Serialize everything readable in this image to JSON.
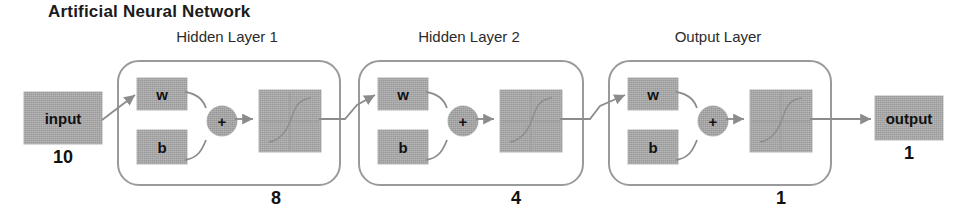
{
  "diagram": {
    "title": "Artificial Neural Network",
    "type": "neural-network-architecture",
    "colors": {
      "block_fill": "#a9a9a9",
      "layer_border": "#9a9a9a",
      "arrow": "#8c8c8c",
      "text": "#1a1a1a"
    },
    "input": {
      "label": "input",
      "count": "10"
    },
    "layers": [
      {
        "caption": "Hidden Layer 1",
        "weight_label": "w",
        "bias_label": "b",
        "sum_label": "+",
        "activation_label": "",
        "count": "8"
      },
      {
        "caption": "Hidden Layer 2",
        "weight_label": "w",
        "bias_label": "b",
        "sum_label": "+",
        "activation_label": "",
        "count": "4"
      },
      {
        "caption": "Output Layer",
        "weight_label": "w",
        "bias_label": "b",
        "sum_label": "+",
        "activation_label": "",
        "count": "1"
      }
    ],
    "output": {
      "label": "output",
      "count": "1"
    }
  }
}
